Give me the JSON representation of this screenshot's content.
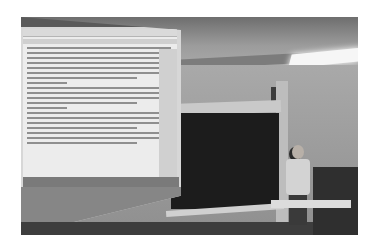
{
  "scene": {
    "description": "Grayscale photo of a classroom: a projected document on a pull-down screen at left, a blackboard in the center, and a person standing at a desk at right",
    "palette": {
      "background": "#ffffff",
      "wall": "#9c9c9c",
      "chalkboard": "#1c1c1c",
      "screen": "#ececec",
      "ceiling_light": "#f6f6f6"
    },
    "projected_screen": {
      "content": "word-processor document with paragraphs of body text",
      "text_legible": false,
      "text_lines": 24,
      "has_taskbar": true,
      "taskbar_icon_count": 12
    },
    "elements": [
      "ceiling",
      "ceiling-light",
      "projection-screen",
      "chalkboard",
      "pillar",
      "person",
      "desk",
      "podium"
    ]
  }
}
